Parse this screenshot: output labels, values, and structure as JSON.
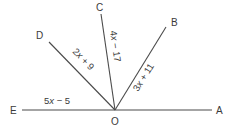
{
  "diagram": {
    "vertex": {
      "name": "O",
      "x": 115,
      "y": 110
    },
    "points": [
      {
        "name": "A",
        "x": 212,
        "y": 110,
        "label_x": 216,
        "label_y": 114
      },
      {
        "name": "B",
        "x": 166,
        "y": 27,
        "label_x": 171,
        "label_y": 26
      },
      {
        "name": "C",
        "x": 101,
        "y": 14,
        "label_x": 96,
        "label_y": 11
      },
      {
        "name": "D",
        "x": 49,
        "y": 42,
        "label_x": 36,
        "label_y": 39
      },
      {
        "name": "E",
        "x": 22,
        "y": 110,
        "label_x": 10,
        "label_y": 114
      }
    ],
    "vertex_label": {
      "text": "O",
      "x": 111,
      "y": 125
    },
    "angle_expressions": [
      {
        "between": "OE",
        "text": "5x − 5",
        "coef": "5",
        "var": "x",
        "rest": " − 5"
      },
      {
        "between": "OD",
        "text": "2x + 9",
        "coef": "2",
        "var": "x",
        "rest": " + 9"
      },
      {
        "between": "OC",
        "text": "4x − 17",
        "coef": "4",
        "var": "x",
        "rest": " − 17"
      },
      {
        "between": "OB",
        "text": "3x + 11",
        "coef": "3",
        "var": "x",
        "rest": " + 11"
      }
    ],
    "line_color": "#4a4a4a",
    "text_color": "#3a3a3a"
  }
}
